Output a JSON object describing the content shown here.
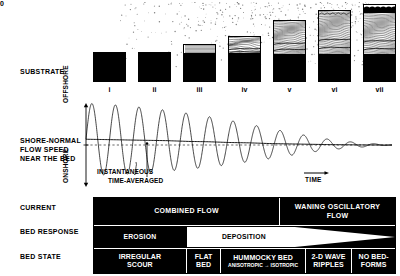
{
  "row_labels": {
    "substrate": "SUBSTRATE",
    "flow_speed": "SHORE-NORMAL\nFLOW SPEED\nNEAR THE BED",
    "flow_speed_lines": [
      "SHORE-NORMAL",
      "FLOW SPEED",
      "NEAR THE BED"
    ],
    "current": "CURRENT",
    "bed_response": "BED RESPONSE",
    "bed_state": "BED STATE"
  },
  "substrate": {
    "stage_labels": [
      "i",
      "ii",
      "iii",
      "iv",
      "v",
      "vi",
      "vii"
    ],
    "panels": [
      {
        "label": "i",
        "total_height": 30,
        "base_height": 28,
        "lamina_height": 0,
        "cap_height": 0,
        "cap_ripples": false,
        "hcs": false
      },
      {
        "label": "ii",
        "total_height": 30,
        "base_height": 29,
        "lamina_height": 0,
        "cap_height": 0,
        "cap_ripples": false,
        "hcs": false
      },
      {
        "label": "iii",
        "total_height": 38,
        "base_height": 26,
        "lamina_height": 11,
        "cap_height": 0,
        "cap_ripples": false,
        "hcs": false
      },
      {
        "label": "iv",
        "total_height": 46,
        "base_height": 26,
        "lamina_height": 19,
        "cap_height": 0,
        "cap_ripples": false,
        "hcs": true
      },
      {
        "label": "v",
        "total_height": 62,
        "base_height": 25,
        "lamina_height": 36,
        "cap_height": 0,
        "cap_ripples": false,
        "hcs": true
      },
      {
        "label": "vi",
        "total_height": 72,
        "base_height": 25,
        "lamina_height": 46,
        "cap_height": 0,
        "cap_ripples": true,
        "hcs": true
      },
      {
        "label": "vii",
        "total_height": 78,
        "base_height": 25,
        "lamina_height": 45,
        "cap_height": 8,
        "cap_ripples": true,
        "hcs": true
      }
    ]
  },
  "plot": {
    "y_axis_top": "OFFSHORE",
    "y_axis_zero": "0",
    "y_axis_bottom": "ONSHORE",
    "x_axis_label": "TIME",
    "annotation_instantaneous": "INSTANTANEOUS",
    "annotation_time_averaged": "TIME-AVERAGED"
  },
  "chart_data": {
    "type": "line",
    "title": "Shore-normal flow speed near the bed",
    "xlabel": "TIME",
    "ylabel": "Flow speed",
    "ytick_labels": [
      "OFFSHORE",
      "0",
      "ONSHORE"
    ],
    "grid": false,
    "legend": [
      "INSTANTANEOUS",
      "TIME-AVERAGED"
    ],
    "series": [
      {
        "name": "INSTANTANEOUS",
        "description": "Decaying oscillatory wave, amplitude falls from maximum at left to zero at right",
        "amplitude_envelope": [
          1.0,
          0.98,
          0.95,
          0.9,
          0.84,
          0.78,
          0.7,
          0.62,
          0.52,
          0.42,
          0.32,
          0.22,
          0.14,
          0.08,
          0.04,
          0.0
        ],
        "cycles": 13
      },
      {
        "name": "TIME-AVERAGED",
        "description": "Smooth mean curve starting slightly offshore-positive, decaying asymptotically to zero",
        "values": [
          0.16,
          0.15,
          0.14,
          0.13,
          0.12,
          0.1,
          0.09,
          0.07,
          0.06,
          0.04,
          0.03,
          0.02,
          0.01,
          0.005,
          0.0,
          0.0
        ]
      }
    ]
  },
  "table": {
    "current_row": [
      {
        "label": "COMBINED FLOW",
        "span_start": 0,
        "span_end": 0.615
      },
      {
        "label": "WANING OSCILLATORY FLOW",
        "lines": [
          "WANING OSCILLATORY",
          "FLOW"
        ],
        "span_start": 0.615,
        "span_end": 1.0
      }
    ],
    "bed_response_row": [
      {
        "label": "EROSION",
        "span_start": 0,
        "span_end": 0.305,
        "style": "dark-fill"
      },
      {
        "label": "DEPOSITION",
        "span_start": 0.305,
        "span_end": 1.0,
        "style": "white-wedge"
      }
    ],
    "bed_state_row": [
      {
        "label": "IRREGULAR SCOUR",
        "lines": [
          "IRREGULAR",
          "SCOUR"
        ],
        "span_start": 0,
        "span_end": 0.305
      },
      {
        "label": "FLAT BED",
        "lines": [
          "FLAT",
          "BED"
        ],
        "span_start": 0.305,
        "span_end": 0.42
      },
      {
        "label": "HUMMOCKY BED",
        "lines": [
          "HUMMOCKY BED"
        ],
        "sub": "ANISOTROPIC → ISOTROPIC",
        "span_start": 0.42,
        "span_end": 0.7
      },
      {
        "label": "2-D WAVE RIPPLES",
        "lines": [
          "2-D WAVE",
          "RIPPLES"
        ],
        "span_start": 0.7,
        "span_end": 0.855
      },
      {
        "label": "NO BED-FORMS",
        "lines": [
          "NO BED-",
          "FORMS"
        ],
        "span_start": 0.855,
        "span_end": 1.0
      }
    ]
  },
  "colors": {
    "ink": "#000000",
    "paper": "#ffffff"
  }
}
